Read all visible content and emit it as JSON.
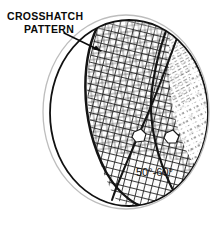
{
  "figure": {
    "background_color": "#ffffff",
    "ink_color": "#111111",
    "width": 224,
    "height": 225
  },
  "annotations": {
    "callout": {
      "line1": "CROSSHATCH",
      "line2": "PATTERN",
      "icon": "leader-line-icon",
      "text_color": "#0a0a0a"
    },
    "angle_label": {
      "text": "50°-60°",
      "text_color": "#111111"
    }
  },
  "regions": [
    {
      "name": "blank-lune-left",
      "description": "unshaded crescent region at left of sphere",
      "fill": "#ffffff"
    },
    {
      "name": "dense-crosshatch-region",
      "description": "dense diamond crosshatch covering central and lower-left sphere",
      "hatch_angles": [
        58,
        -58
      ],
      "density": "dense"
    },
    {
      "name": "sparse-dashed-region",
      "description": "sparse dashed diagonal lineation on right of sphere",
      "hatch_angles": [
        62
      ],
      "density": "sparse"
    }
  ],
  "features": [
    {
      "name": "outer-ellipse-outline",
      "stroke": "#b8b8b8"
    },
    {
      "name": "inner-ellipse-outline",
      "stroke": "#111111"
    },
    {
      "name": "thick-curve-west",
      "stroke": "#111111"
    },
    {
      "name": "thick-curve-east",
      "stroke": "#111111"
    },
    {
      "name": "blank-patch-left",
      "fill": "#ffffff"
    },
    {
      "name": "blank-patch-right",
      "fill": "#ffffff"
    }
  ]
}
